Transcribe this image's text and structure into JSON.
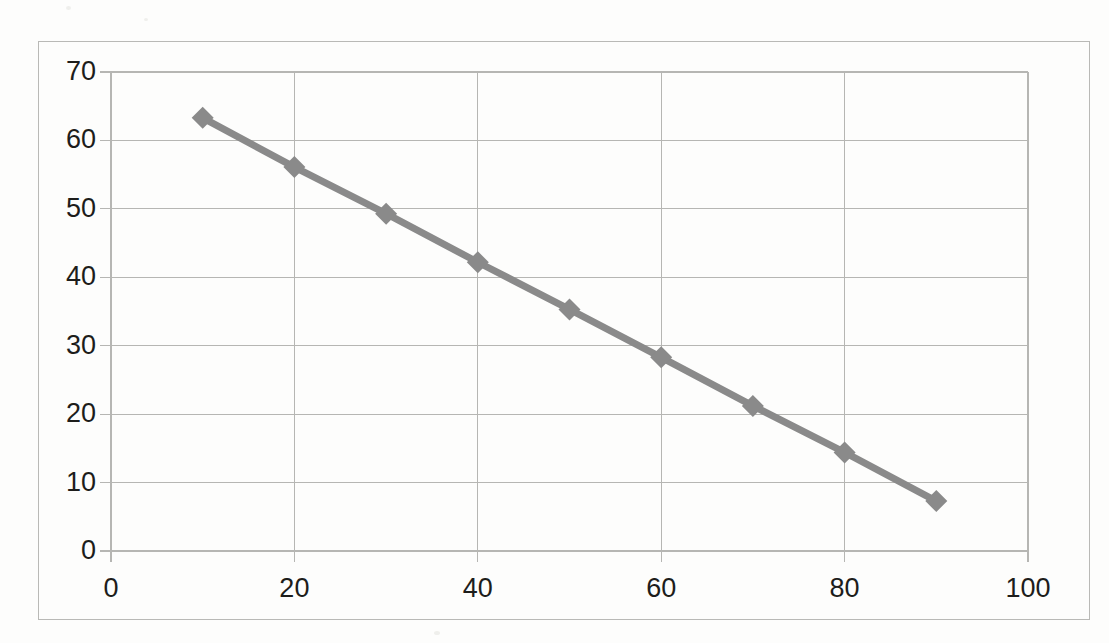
{
  "chart_data": {
    "type": "line",
    "title": "",
    "subtitle": "",
    "xlabel": "",
    "ylabel": "",
    "xlim": [
      0,
      100
    ],
    "ylim": [
      0,
      70
    ],
    "x_ticks": [
      0,
      20,
      40,
      60,
      80,
      100
    ],
    "y_ticks": [
      0,
      10,
      20,
      30,
      40,
      50,
      60,
      70
    ],
    "grid": "both",
    "legend": "none",
    "series": [
      {
        "name": "series-1",
        "color": "#8a8a8a",
        "marker": "diamond",
        "x": [
          10,
          20,
          30,
          40,
          50,
          60,
          70,
          80,
          90
        ],
        "values": [
          63.3,
          56.1,
          49.3,
          42.2,
          35.3,
          28.3,
          21.2,
          14.4,
          7.3
        ]
      }
    ]
  },
  "axes": {
    "y_tick_labels": [
      "70",
      "60",
      "50",
      "40",
      "30",
      "20",
      "10",
      "0"
    ],
    "x_tick_labels": [
      "0",
      "20",
      "40",
      "60",
      "80",
      "100"
    ]
  },
  "style": {
    "line_color": "#8a8a8a",
    "marker_color": "#8a8a8a",
    "grid_color": "#b6b6b3",
    "frame_color": "#b9b9b6",
    "text_color": "#1d1d1b",
    "page_background": "#fdfdfc"
  }
}
